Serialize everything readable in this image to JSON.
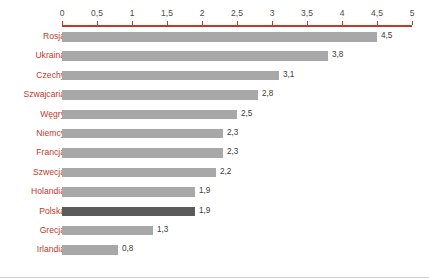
{
  "chart_data": {
    "type": "bar",
    "orientation": "horizontal",
    "title": "",
    "subtitle": "",
    "xlabel": "",
    "ylabel": "",
    "xlim": [
      0,
      5
    ],
    "grid": false,
    "legend": null,
    "tick_labels": [
      "0",
      "0,5",
      "1",
      "1,5",
      "2",
      "2,5",
      "3",
      "3,5",
      "4",
      "4,5",
      "5"
    ],
    "tick_values": [
      0,
      0.5,
      1,
      1.5,
      2,
      2.5,
      3,
      3.5,
      4,
      4.5,
      5
    ],
    "categories": [
      "Rosja",
      "Ukraina",
      "Czechy",
      "Szwajcaria",
      "Węgry",
      "Niemcy",
      "Francja",
      "Szwecja",
      "Holandia",
      "Polska",
      "Grecja",
      "Irlandia"
    ],
    "values": [
      4.5,
      3.8,
      3.1,
      2.8,
      2.5,
      2.3,
      2.3,
      2.2,
      1.9,
      1.9,
      1.3,
      0.8
    ],
    "value_labels": [
      "4,5",
      "3,8",
      "3,1",
      "2,8",
      "2,5",
      "2,3",
      "2,3",
      "2,2",
      "1,9",
      "1,9",
      "1,3",
      "0,8"
    ],
    "highlight_category": "Polska",
    "colors": {
      "bar": "#a8a8a8",
      "bar_highlight": "#5b5b5b",
      "axis": "#c0392b",
      "category_label": "#c0392b",
      "value_label": "#3a3a3a",
      "background": "#ffffff"
    }
  }
}
